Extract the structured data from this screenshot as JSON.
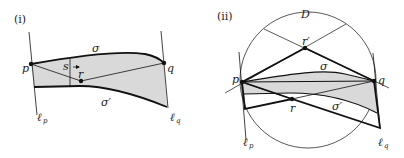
{
  "panels": [
    {
      "id": "i",
      "label": "(i)",
      "points": {
        "p": "p",
        "q": "q",
        "r": "r"
      },
      "curves": {
        "sigma": "σ",
        "sigma_prime": "σ′"
      },
      "lines": {
        "lp": "ℓ",
        "lp_sub": "p",
        "lq": "ℓ",
        "lq_sub": "q"
      },
      "segment_label": "s"
    },
    {
      "id": "ii",
      "label": "(ii)",
      "disk": "D",
      "points": {
        "p": "p",
        "q": "q",
        "r": "r",
        "r_prime": "r′"
      },
      "curves": {
        "sigma": "σ",
        "sigma_prime": "σ′"
      },
      "lines": {
        "lp": "ℓ",
        "lp_sub": "p",
        "lq": "ℓ",
        "lq_sub": "q"
      }
    }
  ],
  "colors": {
    "stroke": "#111111",
    "fill_region": "#d9d9d9",
    "background": "#ffffff"
  }
}
